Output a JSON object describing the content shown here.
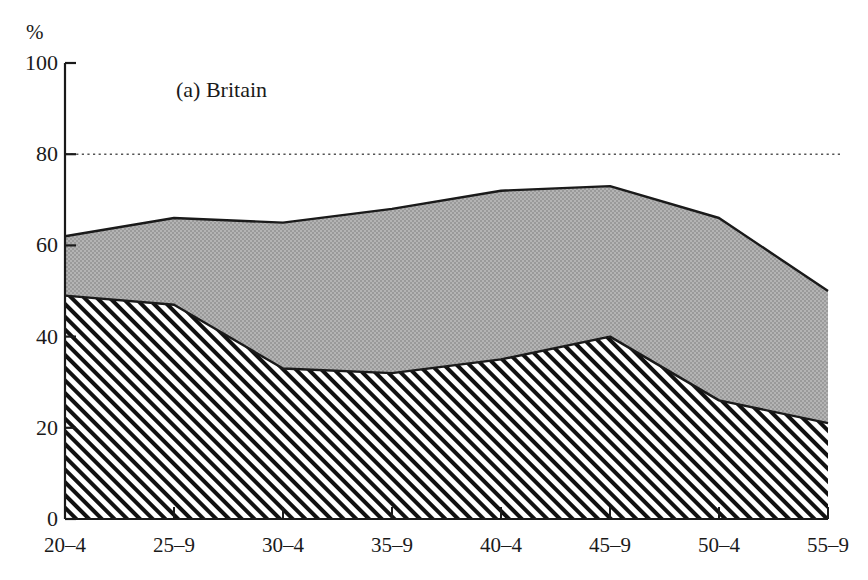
{
  "figure": {
    "clipped_top_text": "",
    "axis_unit_label": "%",
    "panel_title": "(a)  Britain"
  },
  "chart_data": {
    "type": "area",
    "title": "(a)  Britain",
    "subtitle": "",
    "xlabel": "",
    "ylabel": "%",
    "ylim": [
      0,
      100
    ],
    "yticks": [
      0,
      20,
      40,
      60,
      80,
      100
    ],
    "grid": false,
    "stacked": true,
    "legend_position": "none",
    "annotations": [
      {
        "type": "reference-line",
        "axis": "y",
        "value": 80,
        "style": "dotted"
      }
    ],
    "categories": [
      "20–4",
      "25–9",
      "30–4",
      "35–9",
      "40–4",
      "45–9",
      "50–4",
      "55–9"
    ],
    "series": [
      {
        "name": "lower-band-hatched",
        "fill": "diagonal-hatch",
        "values": [
          49,
          47,
          33,
          32,
          35,
          40,
          26,
          21
        ]
      },
      {
        "name": "upper-band-grey",
        "fill": "grey-screen",
        "values": [
          62,
          66,
          65,
          68,
          72,
          73,
          66,
          50
        ]
      }
    ]
  },
  "colors": {
    "grey_fill": "#a9a9a9",
    "line": "#1a1a1a",
    "hatch": "#111111",
    "background": "#ffffff",
    "reference_line": "#555555"
  }
}
